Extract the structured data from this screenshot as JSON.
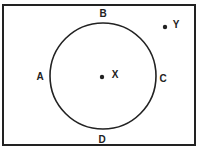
{
  "diagram": {
    "circle": {
      "cx": 103,
      "cy": 76,
      "r": 53,
      "stroke": "#222222"
    },
    "labels": [
      {
        "id": "A",
        "text": "A",
        "x": 40,
        "y": 80
      },
      {
        "id": "B",
        "text": "B",
        "x": 103,
        "y": 17
      },
      {
        "id": "C",
        "text": "C",
        "x": 163,
        "y": 82
      },
      {
        "id": "D",
        "text": "D",
        "x": 102,
        "y": 143
      }
    ],
    "points": [
      {
        "id": "X",
        "label": "X",
        "x": 102,
        "y": 77,
        "lx": 115,
        "ly": 78
      },
      {
        "id": "Y",
        "label": "Y",
        "x": 165,
        "y": 27,
        "lx": 176,
        "ly": 28
      }
    ]
  }
}
